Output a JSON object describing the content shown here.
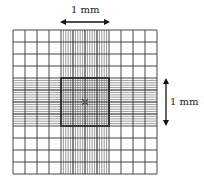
{
  "diagram": {
    "type": "hemocytometer-grid",
    "outer_grid": {
      "x": 13,
      "y": 30,
      "size": 144,
      "divisions": 12
    },
    "center_region": {
      "start_index": 4,
      "span": 4,
      "fine_divisions": 20
    },
    "colors": {
      "line": "#333333",
      "fine_line": "#555555",
      "border": "#222222",
      "arrow": "#111111"
    }
  },
  "labels": {
    "top_dimension": "1 mm",
    "right_dimension": "1 mm"
  }
}
